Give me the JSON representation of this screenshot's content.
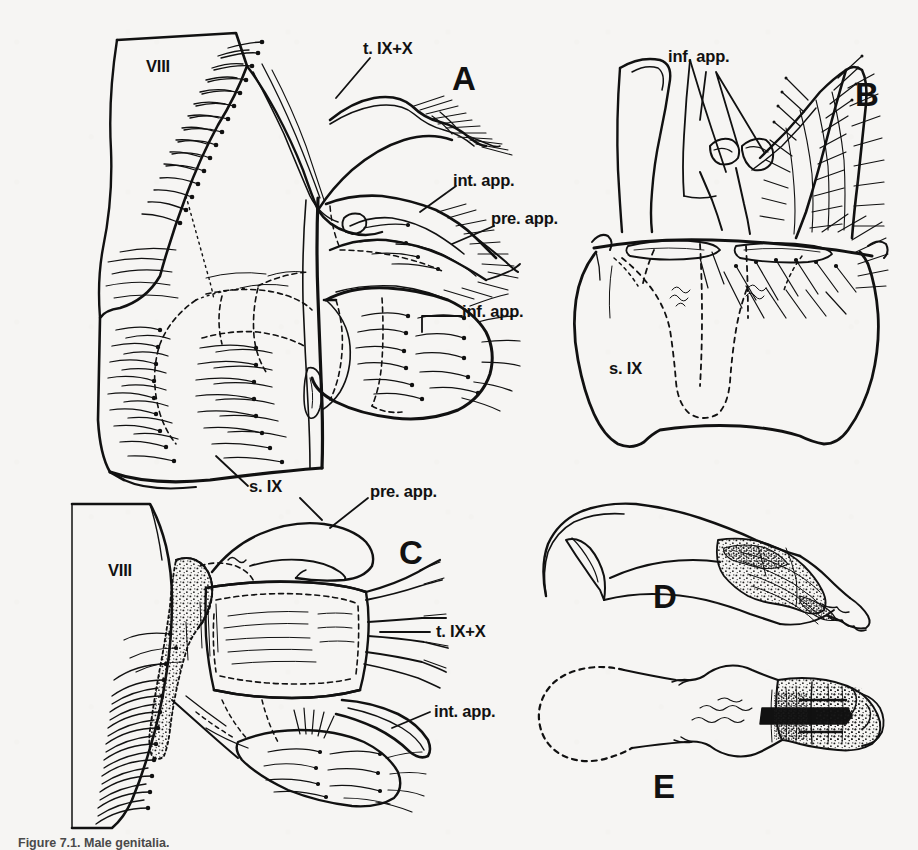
{
  "figure": {
    "background_color": "#f6f5f3",
    "ink_color": "#111111",
    "caption": "Figure 7.1. Male genitalia.",
    "panels": [
      {
        "id": "A",
        "letter": "A",
        "description": "lateral view of male terminalia",
        "labels": [
          {
            "text": "VIII",
            "name": "label-viii-a"
          },
          {
            "text": "t. IX+X",
            "name": "label-t-ix-x-a"
          },
          {
            "text": "int. app.",
            "name": "label-int-app-a"
          },
          {
            "text": "pre. app.",
            "name": "label-pre-app-a"
          },
          {
            "text": "inf. app.",
            "name": "label-inf-app-a"
          },
          {
            "text": "s. IX",
            "name": "label-s-ix-a"
          }
        ]
      },
      {
        "id": "B",
        "letter": "B",
        "description": "ventral view of male terminalia",
        "labels": [
          {
            "text": "inf. app.",
            "name": "label-inf-app-b"
          },
          {
            "text": "s. IX",
            "name": "label-s-ix-b"
          }
        ]
      },
      {
        "id": "C",
        "letter": "C",
        "description": "dorsal view of male terminalia",
        "labels": [
          {
            "text": "VIII",
            "name": "label-viii-c"
          },
          {
            "text": "pre. app.",
            "name": "label-pre-app-c"
          },
          {
            "text": "t. IX+X",
            "name": "label-t-ix-x-c"
          },
          {
            "text": "int. app.",
            "name": "label-int-app-c"
          }
        ]
      },
      {
        "id": "D",
        "letter": "D",
        "description": "phallus, lateral view",
        "labels": []
      },
      {
        "id": "E",
        "letter": "E",
        "description": "phallus, ventral view",
        "labels": []
      }
    ],
    "label_text": {
      "viii": "VIII",
      "t_ix_x": "t. IX+X",
      "int_app": "int. app.",
      "pre_app": "pre. app.",
      "inf_app": "inf. app.",
      "s_ix": "s. IX",
      "panel_a": "A",
      "panel_b": "B",
      "panel_c": "C",
      "panel_d": "D",
      "panel_e": "E"
    }
  }
}
